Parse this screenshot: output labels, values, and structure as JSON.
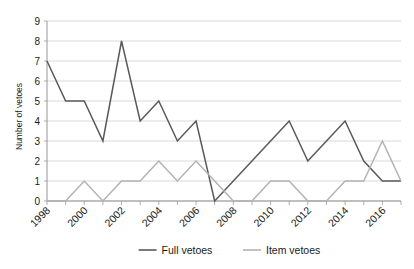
{
  "chart_data": {
    "type": "line",
    "title": "",
    "xlabel": "",
    "ylabel": "Number of vetoes",
    "ylim": [
      0,
      9
    ],
    "ytick_labels": [
      "0",
      "1",
      "2",
      "3",
      "4",
      "5",
      "6",
      "7",
      "8",
      "9"
    ],
    "grid": true,
    "legend_position": "bottom",
    "x": [
      1998,
      1999,
      2000,
      2001,
      2002,
      2003,
      2004,
      2005,
      2006,
      2007,
      2008,
      2009,
      2010,
      2011,
      2012,
      2013,
      2014,
      2015,
      2016,
      2017
    ],
    "xtick_labels": [
      "1998",
      "2000",
      "2002",
      "2004",
      "2006",
      "2008",
      "2010",
      "2012",
      "2014",
      "2016"
    ],
    "xtick_values": [
      1998,
      2000,
      2002,
      2004,
      2006,
      2008,
      2010,
      2012,
      2014,
      2016
    ],
    "series": [
      {
        "name": "Full vetoes",
        "color": "#595959",
        "values": [
          7,
          5,
          5,
          3,
          8,
          4,
          5,
          3,
          4,
          0,
          1,
          2,
          3,
          4,
          2,
          3,
          4,
          2,
          1,
          1
        ]
      },
      {
        "name": "Item vetoes",
        "color": "#b3b3b3",
        "values": [
          0,
          0,
          1,
          0,
          1,
          1,
          2,
          1,
          2,
          1,
          0,
          0,
          1,
          1,
          0,
          0,
          1,
          1,
          3,
          1
        ]
      }
    ]
  },
  "axis": {
    "y_title": "Number of vetoes"
  },
  "legend": {
    "items": [
      {
        "label": "Full vetoes",
        "color": "#595959"
      },
      {
        "label": "Item vetoes",
        "color": "#b3b3b3"
      }
    ]
  }
}
